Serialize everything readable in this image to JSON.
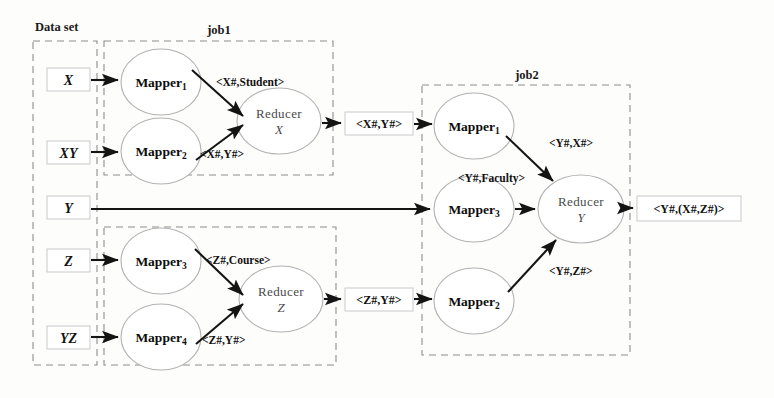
{
  "figure": {
    "background": "#fdfdfc"
  },
  "groups": {
    "dataset": {
      "label": "Data set"
    },
    "job1_top": {
      "label": "job1"
    },
    "job1_bottom": {
      "label": ""
    },
    "job2": {
      "label": "job2"
    }
  },
  "dataset_boxes": [
    {
      "id": "ds-x",
      "label": "X"
    },
    {
      "id": "ds-xy",
      "label": "XY"
    },
    {
      "id": "ds-y",
      "label": "Y"
    },
    {
      "id": "ds-z",
      "label": "Z"
    },
    {
      "id": "ds-yz",
      "label": "YZ"
    }
  ],
  "job1_top": {
    "mappers": [
      {
        "id": "j1-mapper1",
        "name": "Mapper",
        "sub": "1"
      },
      {
        "id": "j1-mapper2",
        "name": "Mapper",
        "sub": "2"
      }
    ],
    "reducer": {
      "id": "j1-reducer-x",
      "name": "Reducer",
      "sub": "X"
    },
    "edge_labels": [
      {
        "id": "j1-edge-student",
        "text": "<X#,Student>"
      },
      {
        "id": "j1-edge-xy",
        "text": "<X#,Y#>"
      }
    ],
    "output": {
      "id": "j1-out-xy",
      "text": "<X#,Y#>"
    }
  },
  "job1_bottom": {
    "mappers": [
      {
        "id": "j1-mapper3",
        "name": "Mapper",
        "sub": "3"
      },
      {
        "id": "j1-mapper4",
        "name": "Mapper",
        "sub": "4"
      }
    ],
    "reducer": {
      "id": "j1-reducer-z",
      "name": "Reducer",
      "sub": "Z"
    },
    "edge_labels": [
      {
        "id": "j1-edge-course",
        "text": "<Z#,Course>"
      },
      {
        "id": "j1-edge-zy",
        "text": "<Z#,Y#>"
      }
    ],
    "output": {
      "id": "j1-out-zy",
      "text": "<Z#,Y#>"
    }
  },
  "job2": {
    "mappers": [
      {
        "id": "j2-mapper1",
        "name": "Mapper",
        "sub": "1"
      },
      {
        "id": "j2-mapper3",
        "name": "Mapper",
        "sub": "3"
      },
      {
        "id": "j2-mapper2",
        "name": "Mapper",
        "sub": "2"
      }
    ],
    "reducer": {
      "id": "j2-reducer-y",
      "name": "Reducer",
      "sub": "Y"
    },
    "edge_labels": [
      {
        "id": "j2-edge-yx",
        "text": "<Y#,X#>"
      },
      {
        "id": "j2-edge-faculty",
        "text": "<Y#,Faculty>"
      },
      {
        "id": "j2-edge-yz",
        "text": "<Y#,Z#>"
      }
    ],
    "output": {
      "id": "j2-out-final",
      "text": "<Y#,(X#,Z#)>"
    }
  },
  "colors": {
    "dash_border": "#8e8e8e",
    "node_border": "#b2b2b2",
    "box_border": "#c9c9c9",
    "arrow": "#141414",
    "text": "#111111",
    "reducer_text": "#4a4a4a"
  }
}
